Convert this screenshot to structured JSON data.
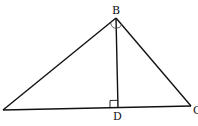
{
  "diagram": {
    "type": "geometry",
    "stroke_color": "#111111",
    "background": "#ffffff",
    "points": {
      "A": {
        "label": "A",
        "x": 3,
        "y": 110
      },
      "B": {
        "label": "B",
        "x": 116,
        "y": 18
      },
      "C": {
        "label": "C",
        "x": 191,
        "y": 106
      },
      "D": {
        "label": "D",
        "x": 118,
        "y": 108
      }
    },
    "labels": {
      "B": "B",
      "C": "C",
      "D": "D"
    },
    "segments": [
      {
        "from": "A",
        "to": "B"
      },
      {
        "from": "B",
        "to": "C"
      },
      {
        "from": "A",
        "to": "C"
      },
      {
        "from": "B",
        "to": "D"
      }
    ],
    "markers": {
      "right_angle_at": "D",
      "angle_arcs_at": "B"
    }
  }
}
